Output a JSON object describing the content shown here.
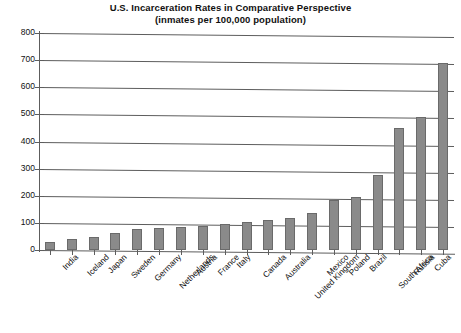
{
  "chart": {
    "title_line1": "U.S. Incarceration Rates in Comparative Perspective",
    "title_line2": "(inmates per 100,000 population)"
  },
  "chart_data": {
    "type": "bar",
    "title": "U.S. Incarceration Rates in Comparative Perspective (inmates per 100,000 population)",
    "xlabel": "",
    "ylabel": "",
    "ylim": [
      0,
      800
    ],
    "ytick_step": 100,
    "yticks": [
      0,
      100,
      200,
      300,
      400,
      500,
      600,
      700,
      800
    ],
    "grid": true,
    "legend": false,
    "bar_color": "#8a8a8a",
    "bar_edge_color": "#6a6a6a",
    "categories": [
      "India",
      "Iceland",
      "Japan",
      "Sweden",
      "Germany",
      "Netherlands",
      "Austria",
      "France",
      "Italy",
      "Canada",
      "Australia",
      "United Kingdom",
      "Mexico",
      "Poland",
      "Brazil",
      "South Africa",
      "Russia",
      "Cuba",
      "United States"
    ],
    "values": [
      30,
      40,
      48,
      64,
      78,
      80,
      85,
      88,
      96,
      102,
      112,
      118,
      135,
      185,
      195,
      275,
      450,
      490,
      690
    ]
  }
}
